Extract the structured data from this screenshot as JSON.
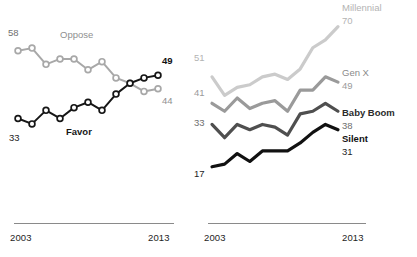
{
  "chart_data": [
    {
      "id": "attitudes",
      "type": "line",
      "title": "",
      "xlabel": "",
      "ylabel": "",
      "x": [
        2003,
        2004,
        2005,
        2006,
        2007,
        2008,
        2009,
        2010,
        2011,
        2012,
        2013
      ],
      "xlim": [
        2003,
        2013
      ],
      "ylim": [
        28,
        62
      ],
      "grid": false,
      "legend_position": "inline-labels",
      "markers": "open-circles",
      "axis_ticks": [
        "2003",
        "2013"
      ],
      "series": [
        {
          "name": "Oppose",
          "color": "#a8a8a8",
          "start_value": 58,
          "end_value": 44,
          "start_label": "58",
          "end_label": "44",
          "label_bold": false,
          "values": [
            58,
            59,
            53,
            55,
            55,
            51,
            54,
            48,
            46,
            43,
            44
          ]
        },
        {
          "name": "Favor",
          "color": "#161616",
          "start_value": 33,
          "end_value": 49,
          "start_label": "33",
          "end_label": "49",
          "label_bold": true,
          "values": [
            33,
            31,
            36,
            33,
            37,
            39,
            36,
            42,
            46,
            48,
            49
          ]
        }
      ]
    },
    {
      "id": "generations",
      "type": "line",
      "title": "",
      "xlabel": "",
      "ylabel": "",
      "x": [
        2003,
        2004,
        2005,
        2006,
        2007,
        2008,
        2009,
        2010,
        2011,
        2012,
        2013
      ],
      "xlim": [
        2003,
        2013
      ],
      "ylim": [
        12,
        74
      ],
      "grid": false,
      "legend_position": "right-inline-labels",
      "markers": "none",
      "axis_ticks": [
        "2003",
        "2013"
      ],
      "series": [
        {
          "name": "Millennial",
          "color": "#cbcbcb",
          "start_value": 51,
          "end_value": 70,
          "start_label": "51",
          "end_label": "70",
          "label_bold": false,
          "values": [
            51,
            44,
            47,
            48,
            51,
            52,
            50,
            54,
            62,
            65,
            70
          ]
        },
        {
          "name": "Gen X",
          "color": "#9a9a9a",
          "start_value": 41,
          "end_value": 49,
          "start_label": "41",
          "end_label": "49",
          "label_bold": false,
          "values": [
            41,
            38,
            43,
            39,
            41,
            42,
            38,
            46,
            46,
            51,
            49
          ]
        },
        {
          "name": "Baby Boom",
          "color": "#4f4f4f",
          "start_value": 33,
          "end_value": 38,
          "start_label": "33",
          "end_label": "38",
          "label_bold": true,
          "values": [
            33,
            28,
            33,
            31,
            33,
            32,
            29,
            37,
            38,
            41,
            38
          ]
        },
        {
          "name": "Silent",
          "color": "#111111",
          "start_value": 17,
          "end_value": 31,
          "start_label": "17",
          "end_label": "31",
          "label_bold": true,
          "values": [
            17,
            18,
            22,
            19,
            23,
            23,
            23,
            26,
            30,
            33,
            31
          ]
        }
      ]
    }
  ],
  "panels": {
    "left": {
      "axis_start": "2003",
      "axis_end": "2013",
      "labels": {
        "oppose_name": "Oppose",
        "oppose_start": "58",
        "oppose_end": "44",
        "favor_name": "Favor",
        "favor_start": "33",
        "favor_end": "49"
      }
    },
    "right": {
      "axis_start": "2003",
      "axis_end": "2013",
      "labels": {
        "millennial_name": "Millennial",
        "millennial_start": "51",
        "millennial_end": "70",
        "genx_name": "Gen X",
        "genx_start": "41",
        "genx_end": "49",
        "babyboom_name": "Baby Boom",
        "babyboom_start": "33",
        "babyboom_end": "38",
        "silent_name": "Silent",
        "silent_start": "17",
        "silent_end": "31"
      }
    }
  },
  "colors": {
    "oppose": "#a8a8a8",
    "favor": "#161616",
    "millennial": "#cbcbcb",
    "genx": "#9a9a9a",
    "babyboom": "#4f4f4f",
    "silent": "#111111",
    "axis": "#8a8a8a",
    "text_dark": "#242424",
    "text_gray": "#8f8f8f"
  }
}
